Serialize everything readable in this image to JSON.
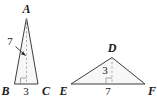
{
  "figure": {
    "type": "geometry-diagram",
    "background_color": "#ffffff",
    "stroke_color": "#3d3d3d",
    "fill_color": "#f7f7f7",
    "dashed_color": "#9a9a9a"
  },
  "triangles": [
    {
      "id": "ABC",
      "name": "triangle-abc",
      "vertices": {
        "apex": {
          "label": "A"
        },
        "bottom_left": {
          "label": "B"
        },
        "bottom_right": {
          "label": "C"
        }
      },
      "measures": {
        "height": {
          "value": "7",
          "has_leader_arrow": true,
          "points_to": "altitude"
        },
        "base": {
          "value": "3"
        }
      },
      "has_altitude": true,
      "has_right_angle_mark": true
    },
    {
      "id": "DEF",
      "name": "triangle-def",
      "vertices": {
        "apex": {
          "label": "D"
        },
        "bottom_left": {
          "label": "E"
        },
        "bottom_right": {
          "label": "F"
        }
      },
      "measures": {
        "height": {
          "value": "3",
          "has_leader_arrow": false,
          "points_to": "altitude"
        },
        "base": {
          "value": "7"
        }
      },
      "has_altitude": true,
      "has_right_angle_mark": true
    }
  ],
  "labels": {
    "a": "A",
    "b": "B",
    "c": "C",
    "d": "D",
    "e": "E",
    "f": "F",
    "abc_height": "7",
    "abc_base": "3",
    "def_height": "3",
    "def_base": "7"
  }
}
